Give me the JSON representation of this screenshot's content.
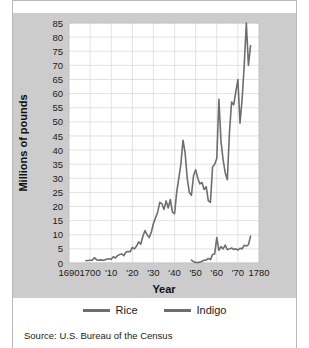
{
  "figure": {
    "background_color": "#ffffff",
    "panel_color": "#cccccc",
    "plot_background": "#ffffff"
  },
  "source_note": "Source: U.S. Bureau of the Census",
  "legend": {
    "position": "below-plot",
    "entries": [
      {
        "label": "Rice",
        "color": "#6e6e6e"
      },
      {
        "label": "Indigo",
        "color": "#6e6e6e"
      }
    ]
  },
  "chart_data": {
    "type": "line",
    "title": "",
    "xlabel": "Year",
    "ylabel": "Millions of pounds",
    "xlim": [
      1690,
      1780
    ],
    "ylim": [
      0,
      85
    ],
    "grid": true,
    "legend_position": "bottom",
    "yticks": [
      0,
      5,
      10,
      15,
      20,
      25,
      30,
      35,
      40,
      45,
      50,
      55,
      60,
      65,
      70,
      75,
      80,
      85
    ],
    "ytick_labels": [
      "0",
      "5",
      "10",
      "15",
      "20",
      "25",
      "30",
      "35",
      "40",
      "45",
      "50",
      "55",
      "60",
      "65",
      "70",
      "75",
      "80",
      "85"
    ],
    "xticks": [
      1690,
      1700,
      1710,
      1720,
      1730,
      1740,
      1750,
      1760,
      1770,
      1780
    ],
    "xtick_labels": [
      "1690",
      "1700",
      "'10",
      "'20",
      "'30",
      "'40",
      "'50",
      "'60",
      "'70",
      "1780"
    ],
    "line_color": "#6e6e6e",
    "line_width": 1.6,
    "series": [
      {
        "name": "Rice",
        "color": "#6e6e6e",
        "x": [
          1698,
          1699,
          1700,
          1701,
          1702,
          1703,
          1704,
          1705,
          1706,
          1707,
          1708,
          1709,
          1710,
          1711,
          1712,
          1713,
          1714,
          1715,
          1716,
          1717,
          1718,
          1719,
          1720,
          1721,
          1722,
          1723,
          1724,
          1725,
          1726,
          1727,
          1728,
          1729,
          1730,
          1731,
          1732,
          1733,
          1734,
          1735,
          1736,
          1737,
          1738,
          1739,
          1740,
          1741,
          1742,
          1743,
          1744,
          1745,
          1746,
          1747,
          1748,
          1749,
          1750,
          1751,
          1752,
          1753,
          1754,
          1755,
          1756,
          1757,
          1758,
          1759,
          1760,
          1761,
          1762,
          1763,
          1764,
          1765,
          1766,
          1767,
          1768,
          1769,
          1770,
          1771,
          1772,
          1773,
          1774,
          1775,
          1776
        ],
        "y": [
          0.8,
          0.9,
          1.0,
          1.0,
          1.9,
          1.2,
          1.0,
          1.1,
          1.0,
          1.1,
          1.4,
          1.5,
          1.3,
          2.2,
          1.8,
          2.6,
          3.0,
          3.2,
          2.6,
          3.9,
          4.1,
          4.0,
          5.5,
          5.0,
          6.0,
          7.5,
          6.7,
          9.5,
          11.5,
          10.0,
          9.0,
          11.0,
          14.0,
          16.0,
          18.0,
          21.5,
          21.0,
          19.0,
          22.0,
          19.5,
          22.5,
          18.0,
          17.5,
          25.0,
          30.0,
          35.0,
          43.5,
          39.0,
          30.0,
          25.0,
          24.0,
          31.0,
          33.0,
          30.0,
          28.0,
          28.5,
          26.0,
          27.0,
          22.0,
          21.5,
          34.0,
          35.0,
          37.0,
          58.0,
          43.0,
          36.5,
          32.0,
          29.5,
          46.0,
          57.0,
          56.0,
          60.5,
          65.0,
          49.5,
          58.0,
          70.0,
          85.0,
          70.0,
          77.0
        ]
      },
      {
        "name": "Indigo",
        "color": "#6e6e6e",
        "x": [
          1748,
          1749,
          1750,
          1751,
          1752,
          1753,
          1754,
          1755,
          1756,
          1757,
          1758,
          1759,
          1760,
          1761,
          1762,
          1763,
          1764,
          1765,
          1766,
          1767,
          1768,
          1769,
          1770,
          1771,
          1772,
          1773,
          1774,
          1775,
          1776
        ],
        "y": [
          1.0,
          0.5,
          0.2,
          0.2,
          0.3,
          0.6,
          1.0,
          1.0,
          1.6,
          1.2,
          3.0,
          3.2,
          9.0,
          4.5,
          5.8,
          5.0,
          6.3,
          4.7,
          5.0,
          5.3,
          4.8,
          5.0,
          4.6,
          5.2,
          5.0,
          6.3,
          6.0,
          6.5,
          9.5
        ]
      }
    ]
  },
  "axes": {
    "ylabel_text": "Millions of pounds",
    "xlabel_text": "Year"
  }
}
